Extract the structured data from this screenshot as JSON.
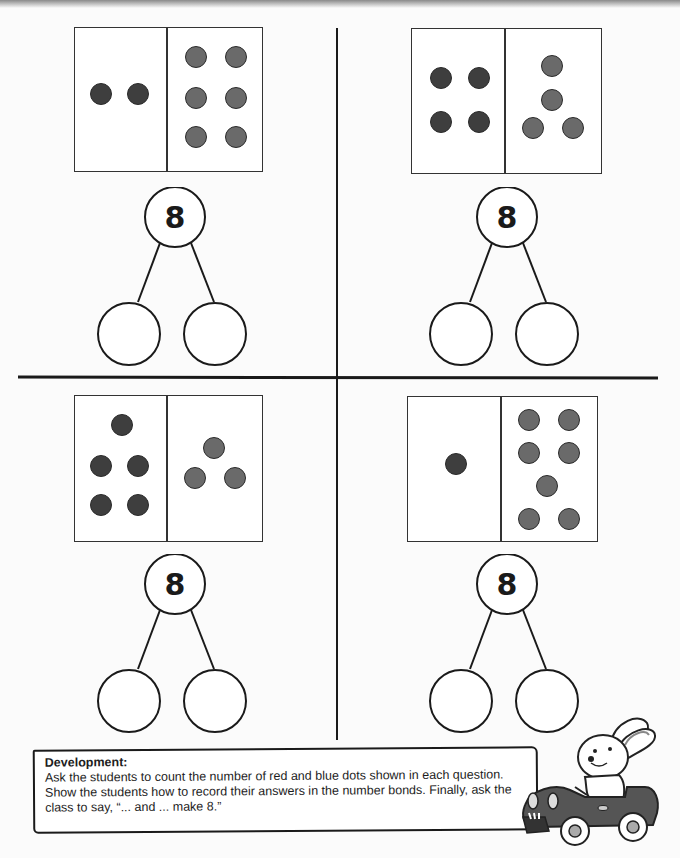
{
  "worksheet": {
    "target_number": "8",
    "questions": [
      {
        "id": "top-left",
        "red_count": 2,
        "blue_count": 6,
        "whole": "8",
        "part_left": "",
        "part_right": ""
      },
      {
        "id": "top-right",
        "red_count": 4,
        "blue_count": 4,
        "whole": "8",
        "part_left": "",
        "part_right": ""
      },
      {
        "id": "bottom-left",
        "red_count": 5,
        "blue_count": 3,
        "whole": "8",
        "part_left": "",
        "part_right": ""
      },
      {
        "id": "bottom-right",
        "red_count": 1,
        "blue_count": 7,
        "whole": "8",
        "part_left": "",
        "part_right": ""
      }
    ]
  },
  "note": {
    "title": "Development:",
    "body": "Ask the students to count the number of red and blue dots shown in each question. Show the students how to record their answers in the number bonds. Finally, ask the class to say, “... and ... make 8.”"
  },
  "colors": {
    "red_dot": "#3e3e3e",
    "blue_dot": "#6a6a6a",
    "line": "#1a1a1a"
  },
  "mascot": {
    "description": "rabbit-driving-car"
  }
}
